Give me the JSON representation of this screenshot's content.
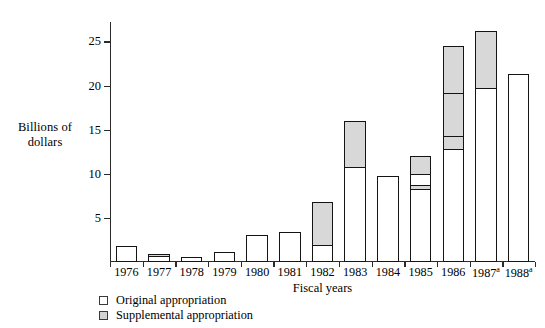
{
  "chart_data": {
    "type": "bar",
    "stacked": true,
    "title": "",
    "xlabel": "Fiscal years",
    "ylabel": "Billions of dollars",
    "ylim": [
      0,
      27.2
    ],
    "yticks": [
      5,
      10,
      15,
      20,
      25
    ],
    "grid": false,
    "legend_position": "bottom-left",
    "categories": [
      "1976",
      "1977",
      "1978",
      "1979",
      "1980",
      "1981",
      "1982",
      "1983",
      "1984",
      "1985",
      "1986",
      "1987",
      "1988"
    ],
    "category_footnotes": [
      "",
      "",
      "",
      "",
      "",
      "",
      "",
      "",
      "",
      "",
      "",
      "a",
      "a"
    ],
    "series": [
      {
        "name": "Original appropriation",
        "color": "#ffffff",
        "values": [
          1.9,
          0.7,
          0.6,
          1.2,
          3.1,
          3.5,
          2.0,
          10.8,
          9.8,
          10.3,
          19.5,
          19.8,
          21.3
        ]
      },
      {
        "name": "Supplemental appropriation",
        "color": "#d8d8d8",
        "values": [
          0.0,
          0.4,
          0.2,
          0.0,
          0.0,
          0.0,
          5.0,
          5.4,
          0.0,
          2.2,
          5.5,
          6.6,
          0.0
        ]
      }
    ],
    "stacks": [
      {
        "year": "1976",
        "total": 1.9,
        "segments": [
          {
            "type": "original",
            "from": 0,
            "to": 1.9
          }
        ]
      },
      {
        "year": "1977",
        "total": 1.1,
        "segments": [
          {
            "type": "original",
            "from": 0,
            "to": 0.7
          },
          {
            "type": "supplemental",
            "from": 0.7,
            "to": 1.1
          }
        ]
      },
      {
        "year": "1978",
        "total": 0.8,
        "segments": [
          {
            "type": "original",
            "from": 0,
            "to": 0.6
          },
          {
            "type": "supplemental",
            "from": 0.6,
            "to": 0.8
          }
        ]
      },
      {
        "year": "1979",
        "total": 1.2,
        "segments": [
          {
            "type": "original",
            "from": 0,
            "to": 1.2
          }
        ]
      },
      {
        "year": "1980",
        "total": 3.1,
        "segments": [
          {
            "type": "original",
            "from": 0,
            "to": 3.1
          }
        ]
      },
      {
        "year": "1981",
        "total": 3.5,
        "segments": [
          {
            "type": "original",
            "from": 0,
            "to": 3.5
          }
        ]
      },
      {
        "year": "1982",
        "total": 7.0,
        "segments": [
          {
            "type": "original",
            "from": 0,
            "to": 2.0
          },
          {
            "type": "supplemental",
            "from": 2.0,
            "to": 7.0
          }
        ]
      },
      {
        "year": "1983",
        "total": 16.2,
        "segments": [
          {
            "type": "original",
            "from": 0,
            "to": 10.8
          },
          {
            "type": "supplemental",
            "from": 10.8,
            "to": 16.2
          }
        ]
      },
      {
        "year": "1984",
        "total": 9.8,
        "segments": [
          {
            "type": "original",
            "from": 0,
            "to": 9.8
          }
        ]
      },
      {
        "year": "1985",
        "total": 12.5,
        "segments": [
          {
            "type": "original",
            "from": 0,
            "to": 8.3
          },
          {
            "type": "supplemental",
            "from": 8.3,
            "to": 8.9
          },
          {
            "type": "original",
            "from": 8.9,
            "to": 10.3
          },
          {
            "type": "supplemental",
            "from": 10.3,
            "to": 12.5
          }
        ]
      },
      {
        "year": "1986",
        "total": 25.0,
        "segments": [
          {
            "type": "original",
            "from": 0,
            "to": 12.8
          },
          {
            "type": "supplemental",
            "from": 12.8,
            "to": 14.5
          },
          {
            "type": "supplemental",
            "from": 14.5,
            "to": 19.5
          },
          {
            "type": "supplemental",
            "from": 19.5,
            "to": 25.0
          }
        ]
      },
      {
        "year": "1987",
        "total": 26.4,
        "segments": [
          {
            "type": "original",
            "from": 0,
            "to": 19.8
          },
          {
            "type": "supplemental",
            "from": 19.8,
            "to": 26.4
          }
        ]
      },
      {
        "year": "1988",
        "total": 21.3,
        "segments": [
          {
            "type": "original",
            "from": 0,
            "to": 21.3
          }
        ]
      }
    ]
  },
  "legend": {
    "items": [
      {
        "label": "Original appropriation",
        "swatch": "original"
      },
      {
        "label": "Supplemental appropriation",
        "swatch": "supplemental"
      }
    ]
  }
}
